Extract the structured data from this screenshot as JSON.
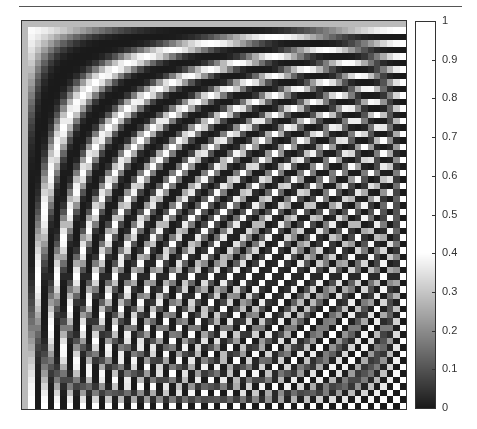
{
  "chart_data": {
    "type": "heatmap",
    "title": "",
    "xlabel": "",
    "ylabel": "",
    "grid": false,
    "rows": 60,
    "cols": 60,
    "value_range_in_data": [
      0,
      0.4
    ],
    "colorbar": {
      "position": "right",
      "range": [
        0,
        1
      ],
      "ticks": [
        0,
        0.1,
        0.2,
        0.3,
        0.4,
        0.5,
        0.6,
        0.7,
        0.8,
        0.9,
        1
      ],
      "tick_labels": [
        "0",
        "0.1",
        "0.2",
        "0.3",
        "0.4",
        "0.5",
        "0.6",
        "0.7",
        "0.8",
        "0.9",
        "1"
      ],
      "colormap": "gray",
      "saturates_white_above": 0.4
    }
  },
  "colors": {
    "low": "#1a1a1a",
    "high": "#ffffff",
    "frame": "#333333"
  }
}
